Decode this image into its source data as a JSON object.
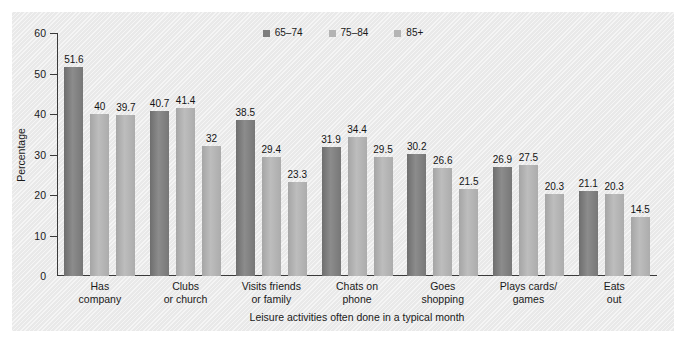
{
  "chart_data": {
    "type": "bar",
    "title": "",
    "xlabel": "Leisure activities often done in a typical month",
    "ylabel": "Percentage",
    "ylim": [
      0,
      60
    ],
    "yticks": [
      0,
      10,
      20,
      30,
      40,
      50,
      60
    ],
    "grid": false,
    "legend_position": "top-center",
    "categories": [
      "Has company",
      "Clubs or church",
      "Visits friends or family",
      "Chats on phone",
      "Goes shopping",
      "Plays cards/ games",
      "Eats out"
    ],
    "category_lines": [
      [
        "Has",
        "company"
      ],
      [
        "Clubs",
        "or church"
      ],
      [
        "Visits friends",
        "or family"
      ],
      [
        "Chats on",
        "phone"
      ],
      [
        "Goes",
        "shopping"
      ],
      [
        "Plays cards/",
        "games"
      ],
      [
        "Eats",
        "out"
      ]
    ],
    "series": [
      {
        "name": "65–74",
        "color": "#7d7d7d",
        "values": [
          51.6,
          40.7,
          38.5,
          31.9,
          30.2,
          26.9,
          21.1
        ],
        "labels": [
          "51.6",
          "40.7",
          "38.5",
          "31.9",
          "30.2",
          "26.9",
          "21.1"
        ]
      },
      {
        "name": "75–84",
        "color": "#b4b4b4",
        "values": [
          40,
          41.4,
          29.4,
          34.4,
          26.6,
          27.5,
          20.3
        ],
        "labels": [
          "40",
          "41.4",
          "29.4",
          "34.4",
          "26.6",
          "27.5",
          "20.3"
        ]
      },
      {
        "name": "85+",
        "color": "#b4b4b4",
        "values": [
          39.7,
          32,
          23.3,
          29.5,
          21.5,
          20.3,
          14.5
        ],
        "labels": [
          "39.7",
          "32",
          "23.3",
          "29.5",
          "21.5",
          "20.3",
          "14.5"
        ]
      }
    ]
  }
}
